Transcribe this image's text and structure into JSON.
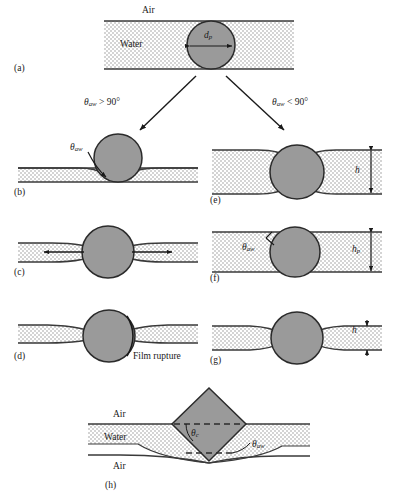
{
  "figure": {
    "type": "scientific-schematic",
    "colors": {
      "particle_fill": "#9a9a9a",
      "particle_stroke": "#2b2b2b",
      "water_fill": "#dcdcdc",
      "film_line": "#3a3a3a",
      "background": "#ffffff",
      "text": "#1a1a1a"
    }
  },
  "panels": {
    "a": {
      "label": "(a)",
      "air_label": "Air",
      "water_label": "Water",
      "diameter_symbol": "d",
      "diameter_subscript": "p"
    },
    "branch": {
      "left_condition_symbol": "θ",
      "left_condition_sub": "aw",
      "left_condition_rest": " > 90°",
      "right_condition_symbol": "θ",
      "right_condition_sub": "aw",
      "right_condition_rest": " < 90°"
    },
    "b": {
      "label": "(b)",
      "angle_symbol": "θ",
      "angle_sub": "aw"
    },
    "c": {
      "label": "(c)"
    },
    "d": {
      "label": "(d)",
      "caption": "Film rupture"
    },
    "e": {
      "label": "(e)",
      "height_symbol": "h"
    },
    "f": {
      "label": "(f)",
      "angle_symbol": "θ",
      "angle_sub": "aw",
      "height_symbol": "h",
      "height_sub": "p"
    },
    "g": {
      "label": "(g)",
      "height_symbol": "h"
    },
    "h": {
      "label": "(h)",
      "air_top_label": "Air",
      "water_label": "Water",
      "air_bottom_label": "Air",
      "angle_c_symbol": "θ",
      "angle_c_sub": "c",
      "angle_aw_symbol": "θ",
      "angle_aw_sub": "aw"
    }
  }
}
